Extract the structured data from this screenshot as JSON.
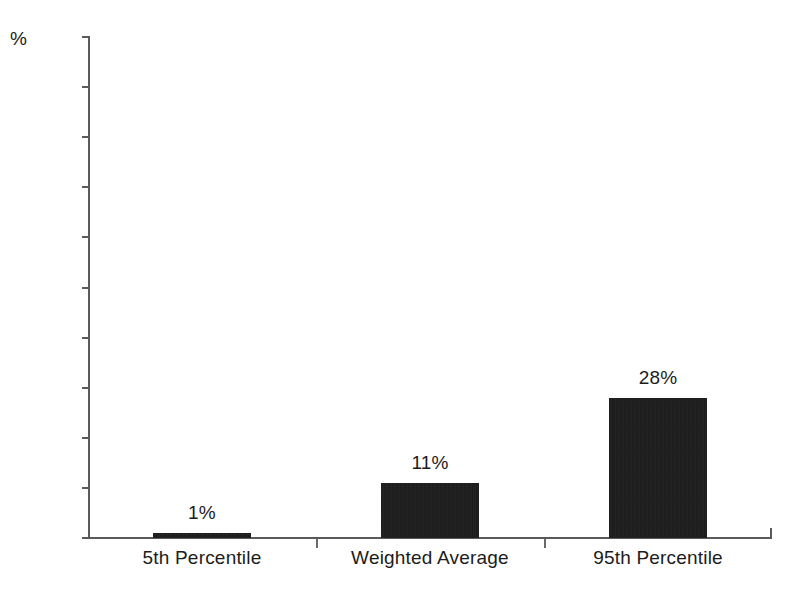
{
  "chart_data": {
    "type": "bar",
    "title": "",
    "xlabel": "",
    "ylabel": "%",
    "unit_label": "%",
    "categories": [
      "5th Percentile",
      "Weighted Average",
      "95th Percentile"
    ],
    "values": [
      1,
      11,
      28
    ],
    "value_labels": [
      "1%",
      "11%",
      "28%"
    ],
    "ylim": [
      0,
      100
    ],
    "ytick_step": 10,
    "yticks": [
      100,
      90,
      80,
      70,
      60,
      50,
      40,
      30,
      20,
      10,
      0
    ],
    "ytick_labels": [
      "100",
      "90",
      "80",
      "70",
      "60",
      "50",
      "40",
      "30",
      "20",
      "10",
      "0"
    ],
    "grid": false,
    "legend": false,
    "legend_position": "none",
    "bar_color": "#151515",
    "axis_color": "#5a5a5a",
    "text_color": "#1c1c1c",
    "background_color": "#ffffff"
  }
}
